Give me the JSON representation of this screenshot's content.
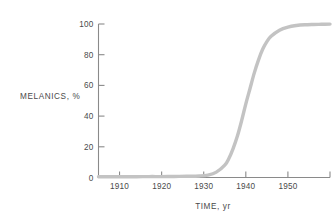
{
  "chart_data": {
    "type": "line",
    "title": "",
    "subtitle": "",
    "xlabel": "TIME, yr",
    "ylabel": "MELANICS, %",
    "xlim": [
      1905,
      1960
    ],
    "ylim": [
      0,
      100
    ],
    "grid": false,
    "legend": null,
    "x_ticks": [
      {
        "value": 1910,
        "label": "1910"
      },
      {
        "value": 1920,
        "label": "1920"
      },
      {
        "value": 1930,
        "label": "1930"
      },
      {
        "value": 1940,
        "label": "1940"
      },
      {
        "value": 1950,
        "label": "1950"
      },
      {
        "value": 1960,
        "label": ""
      }
    ],
    "y_ticks": [
      {
        "value": 0,
        "label": "0"
      },
      {
        "value": 20,
        "label": "20"
      },
      {
        "value": 40,
        "label": "40"
      },
      {
        "value": 60,
        "label": "60"
      },
      {
        "value": 80,
        "label": "80"
      },
      {
        "value": 100,
        "label": "100"
      }
    ],
    "series": [
      {
        "name": "Melanic frequency",
        "color": "#c3c3c3",
        "line_width": 3.4,
        "x": [
          1905,
          1908,
          1911,
          1914,
          1917,
          1920,
          1923,
          1926,
          1929,
          1931,
          1933,
          1935,
          1936,
          1937,
          1938,
          1939,
          1940,
          1941,
          1942,
          1943,
          1944,
          1945,
          1946,
          1948,
          1950,
          1952,
          1954,
          1956,
          1958,
          1960
        ],
        "values": [
          0.5,
          0.5,
          0.5,
          0.5,
          0.6,
          0.6,
          0.7,
          0.8,
          1.0,
          1.6,
          3.5,
          8.0,
          12.5,
          19.0,
          27.0,
          37.0,
          48.0,
          58.0,
          68.0,
          76.5,
          83.5,
          88.5,
          92.0,
          96.0,
          98.0,
          99.0,
          99.5,
          99.7,
          99.8,
          99.9
        ]
      }
    ],
    "annotations": []
  },
  "figure": {
    "background_color": "#ffffff",
    "axis_color": "#8a8a8a",
    "text_color": "#4a4a4a",
    "curve_color": "#c3c3c3"
  }
}
